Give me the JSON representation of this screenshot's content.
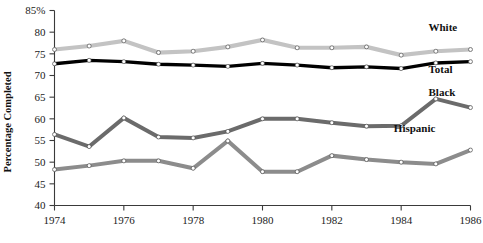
{
  "chart_data": {
    "type": "line",
    "title": "",
    "xlabel": "",
    "ylabel": "Percentage Completed",
    "x": [
      1974,
      1975,
      1976,
      1977,
      1978,
      1979,
      1980,
      1981,
      1982,
      1983,
      1984,
      1985,
      1986
    ],
    "xlim": [
      1974,
      1986
    ],
    "ylim": [
      40,
      85
    ],
    "yticks": [
      "40",
      "45",
      "50",
      "55",
      "60",
      "65",
      "70",
      "75",
      "80",
      "85%"
    ],
    "ytick_values": [
      40,
      45,
      50,
      55,
      60,
      65,
      70,
      75,
      80,
      85
    ],
    "xticks": [
      "1974",
      "1976",
      "1978",
      "1980",
      "1982",
      "1984",
      "1986"
    ],
    "xtick_values": [
      1974,
      1976,
      1978,
      1980,
      1982,
      1984,
      1986
    ],
    "grid": false,
    "legend_position": "right-inline",
    "series": [
      {
        "name": "White",
        "color": "#c3c3c3",
        "width": 4.2,
        "label_x": 1986.0,
        "label_y": 80.2,
        "values": [
          76.0,
          76.8,
          78.0,
          75.3,
          75.6,
          76.6,
          78.2,
          76.4,
          76.4,
          76.6,
          74.7,
          75.6,
          76.0
        ]
      },
      {
        "name": "Total",
        "color": "#000000",
        "width": 3.4,
        "label_x": 1986.0,
        "label_y": 70.6,
        "values": [
          72.7,
          73.5,
          73.2,
          72.6,
          72.4,
          72.1,
          72.8,
          72.4,
          71.8,
          72.0,
          71.6,
          72.9,
          73.2
        ]
      },
      {
        "name": "Black",
        "color": "#6b6b6b",
        "width": 4.0,
        "label_x": 1986.0,
        "label_y": 65.2,
        "values": [
          56.4,
          53.6,
          60.2,
          55.8,
          55.6,
          57.1,
          60.0,
          60.0,
          59.1,
          58.3,
          58.4,
          64.6,
          62.6
        ]
      },
      {
        "name": "Hispanic",
        "color": "#8c8c8c",
        "width": 4.0,
        "label_x": 1985.0,
        "label_y": 57.0,
        "values": [
          48.3,
          49.2,
          50.3,
          50.3,
          48.6,
          54.9,
          47.8,
          47.8,
          51.5,
          50.6,
          50.0,
          49.6,
          52.8
        ]
      }
    ]
  },
  "axes": {
    "y_title": "Percentage Completed"
  }
}
